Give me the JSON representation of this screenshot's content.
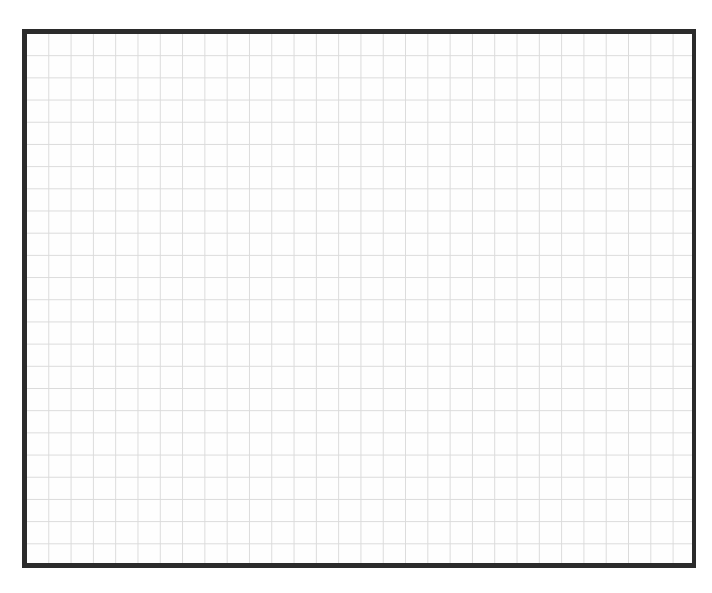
{
  "document": {
    "title": "Blank Grid Paper",
    "type": "graph-paper-sheet",
    "page_background": "#ffffff",
    "sheet_background": "#ffffff"
  },
  "sheet": {
    "frame_color": "#2b2b2b",
    "frame_border_top_px": 5,
    "frame_border_left_px": 5,
    "frame_border_right_px": 4,
    "frame_border_bottom_px": 5,
    "offset_left_px": 22,
    "offset_top_px": 29,
    "width_px": 674,
    "height_px": 539
  },
  "grid": {
    "line_color": "#c9c9c9",
    "line_width_px": 1,
    "cell_width_px": 22.3,
    "cell_height_px": 22.2,
    "columns": 30,
    "rows": 24,
    "subdivisions": 0,
    "labels": [],
    "annotations": []
  },
  "chart_data": {
    "type": "table",
    "title": "",
    "xlabel": "",
    "ylabel": "",
    "categories": [],
    "values": [],
    "grid": true,
    "legend": "none",
    "note": "Empty ruled grid sheet: no plotted data, no tick labels, no legend, no annotations."
  }
}
